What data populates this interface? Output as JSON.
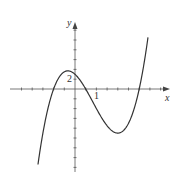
{
  "chart_data": {
    "type": "line",
    "title": "",
    "xlabel": "x",
    "ylabel": "y",
    "tick_labels": {
      "x": [
        "1"
      ],
      "y": [
        "2"
      ]
    },
    "x_tick_step": 0.5,
    "y_tick_step": 2,
    "xlim": [
      -3.5,
      4.3
    ],
    "ylim": [
      -16,
      14
    ],
    "grid": false,
    "legend": null,
    "series": [
      {
        "name": "f(x)",
        "function": "cubic with roots near x=-1, 0.5, 3",
        "x": [
          -1.75,
          -1.5,
          -1.25,
          -1,
          -0.75,
          -0.5,
          -0.25,
          0,
          0.25,
          0.5,
          0.75,
          1,
          1.25,
          1.5,
          1.75,
          2,
          2.25,
          2.5,
          2.75,
          3,
          3.25,
          3.5,
          3.75
        ],
        "y": [
          -14.4,
          -8.8,
          -4.5,
          0,
          2.1,
          3.5,
          3.6,
          3.0,
          1.6,
          0,
          -2.1,
          -4.0,
          -5.9,
          -7.5,
          -8.6,
          -9.0,
          -8.7,
          -7.5,
          -4.7,
          0,
          4.6,
          10.5,
          14.5
        ]
      }
    ],
    "key_points": {
      "roots": [
        -1,
        0.5,
        3
      ],
      "y_intercept": 3,
      "local_max": {
        "x": -0.3,
        "y": 3.6
      },
      "local_min": {
        "x": 2.0,
        "y": -9.0
      }
    },
    "colors": {
      "curve": "#333333",
      "axes": "#555555"
    }
  }
}
